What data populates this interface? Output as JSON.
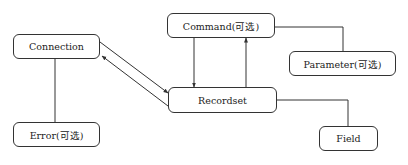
{
  "diagram": {
    "type": "object-model",
    "nodes": [
      {
        "id": "command",
        "label": "Command(可选)",
        "x": 167,
        "y": 13,
        "w": 108,
        "h": 25
      },
      {
        "id": "connection",
        "label": "Connection",
        "x": 13,
        "y": 34,
        "w": 87,
        "h": 25
      },
      {
        "id": "parameter",
        "label": "Parameter(可选)",
        "x": 289,
        "y": 51,
        "w": 107,
        "h": 25
      },
      {
        "id": "recordset",
        "label": "Recordset",
        "x": 168,
        "y": 87,
        "w": 109,
        "h": 26
      },
      {
        "id": "error",
        "label": "Error(可选)",
        "x": 13,
        "y": 122,
        "w": 87,
        "h": 25
      },
      {
        "id": "field",
        "label": "Field",
        "x": 319,
        "y": 126,
        "w": 59,
        "h": 25
      }
    ],
    "edges": [
      {
        "from": "connection",
        "to": "recordset",
        "arrow": "end",
        "style": "diagonal"
      },
      {
        "from": "recordset",
        "to": "connection",
        "arrow": "end",
        "style": "diagonal"
      },
      {
        "from": "command",
        "to": "recordset",
        "arrow": "end",
        "style": "vertical"
      },
      {
        "from": "recordset",
        "to": "command",
        "arrow": "end",
        "style": "vertical"
      },
      {
        "from": "command",
        "to": "parameter",
        "arrow": "none",
        "style": "elbow"
      },
      {
        "from": "recordset",
        "to": "field",
        "arrow": "none",
        "style": "elbow"
      },
      {
        "from": "connection",
        "to": "error",
        "arrow": "none",
        "style": "vertical"
      }
    ],
    "colors": {
      "stroke": "#333333",
      "text": "#222222",
      "background": "#ffffff"
    }
  }
}
